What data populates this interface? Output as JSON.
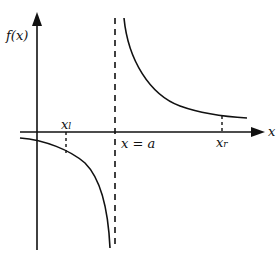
{
  "figure": {
    "y_axis_label": "f(x)",
    "x_axis_label": "x",
    "asymptote_label": "x = a",
    "x_left_label": "x",
    "x_left_sub": "l",
    "x_right_label": "x",
    "x_right_sub": "r"
  },
  "colors": {
    "ink": "#111111",
    "background": "#ffffff"
  }
}
